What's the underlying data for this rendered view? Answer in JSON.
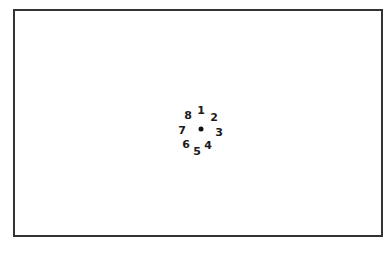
{
  "diagram": {
    "center": {
      "x": 201,
      "y": 129
    },
    "labels": [
      {
        "text": "1",
        "x": 201,
        "y": 110
      },
      {
        "text": "2",
        "x": 214,
        "y": 117
      },
      {
        "text": "3",
        "x": 219,
        "y": 132
      },
      {
        "text": "4",
        "x": 208,
        "y": 145
      },
      {
        "text": "5",
        "x": 197,
        "y": 151
      },
      {
        "text": "6",
        "x": 186,
        "y": 144
      },
      {
        "text": "7",
        "x": 182,
        "y": 130
      },
      {
        "text": "8",
        "x": 188,
        "y": 115
      }
    ]
  }
}
